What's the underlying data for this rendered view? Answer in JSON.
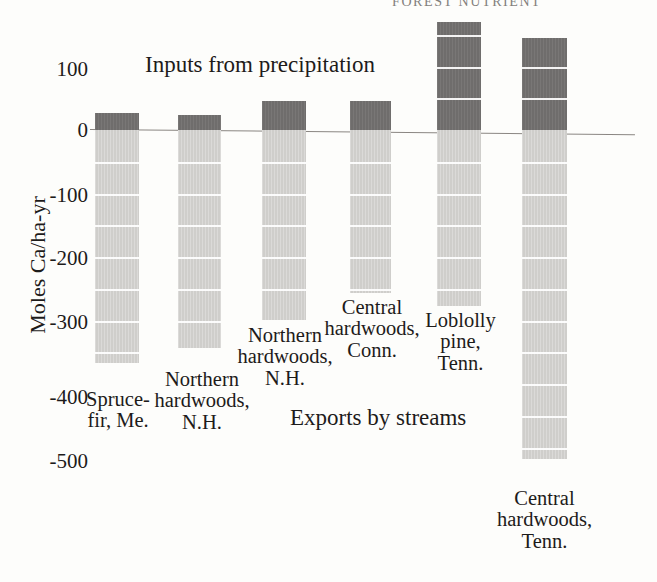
{
  "header": {
    "cropped_text": "FOREST NUTRIENT"
  },
  "chart_data": {
    "type": "bar",
    "title": "",
    "subtitle": "",
    "xlabel": "",
    "ylabel": "Moles Ca/ha-yr",
    "ylim": [
      -560,
      190
    ],
    "grid": true,
    "grid_interval": 50,
    "legend_position": "inline-annotation",
    "annotations": [
      {
        "text": "Inputs from precipitation",
        "x": 145,
        "y": 55
      },
      {
        "text": "Exports by streams",
        "x": 290,
        "y": 405
      }
    ],
    "ytick_labels": [
      "100",
      "0",
      "-100",
      "-200",
      "-300",
      "-400",
      "-500"
    ],
    "ytick_values": [
      100,
      0,
      -100,
      -200,
      -300,
      -400,
      -500
    ],
    "categories": [
      "Spruce-\nfir, Me.",
      "Northern\nhardwoods,\nN.H.",
      "Northern\nhardwoods,\nN.H.",
      "Central\nhardwoods,\nConn.",
      "Loblolly\npine,\nTenn.",
      "Central\nhardwoods,\nTenn."
    ],
    "series": [
      {
        "name": "Inputs from precipitation",
        "color": "#6f6d6c",
        "values": [
          27,
          24,
          46,
          46,
          172,
          147
        ]
      },
      {
        "name": "Exports by streams",
        "color": "#cfcecb",
        "values": [
          -370,
          -345,
          -300,
          -258,
          -278,
          -520
        ]
      }
    ]
  },
  "yticks": [
    {
      "label": "100",
      "top": 57,
      "right": 88
    },
    {
      "label": "0",
      "top": 118,
      "right": 88
    },
    {
      "label": "-100",
      "top": 183,
      "right": 88
    },
    {
      "label": "-200",
      "top": 246,
      "right": 88
    },
    {
      "label": "-300",
      "top": 310,
      "right": 88
    },
    {
      "label": "-400",
      "top": 385,
      "right": 88
    },
    {
      "label": "-500",
      "top": 449,
      "right": 88
    }
  ],
  "bars": [
    {
      "name": "spruce-fir-me",
      "left": 95,
      "width": 44,
      "pos_top": 113,
      "pos_height": 17,
      "neg_top": 130,
      "neg_height": 233,
      "label": "Spruce-\nfir, Me.",
      "label_left": 58,
      "label_top": 389,
      "label_width": 120
    },
    {
      "name": "northern-hardwoods-nh-1",
      "left": 178,
      "width": 43,
      "pos_top": 115,
      "pos_height": 15,
      "neg_top": 130,
      "neg_height": 218,
      "label": "Northern\nhardwoods,\nN.H.",
      "label_left": 152,
      "label_top": 369,
      "label_width": 100
    },
    {
      "name": "northern-hardwoods-nh-2",
      "left": 262,
      "width": 44,
      "pos_top": 101,
      "pos_height": 29,
      "neg_top": 130,
      "neg_height": 190,
      "label": "Northern\nhardwoods,\nN.H.",
      "label_left": 235,
      "label_top": 325,
      "label_width": 100
    },
    {
      "name": "central-hardwoods-conn",
      "left": 350,
      "width": 41,
      "pos_top": 101,
      "pos_height": 29,
      "neg_top": 130,
      "neg_height": 163,
      "label": "Central\nhardwoods,\nConn.",
      "label_left": 322,
      "label_top": 297,
      "label_width": 100
    },
    {
      "name": "loblolly-pine-tenn",
      "left": 437,
      "width": 44,
      "pos_top": 22,
      "pos_height": 108,
      "neg_top": 130,
      "neg_height": 176,
      "label": "Loblolly\npine,\nTenn.",
      "label_left": 413,
      "label_top": 310,
      "label_width": 95
    },
    {
      "name": "central-hardwoods-tenn",
      "left": 522,
      "width": 45,
      "pos_top": 38,
      "pos_height": 92,
      "neg_top": 130,
      "neg_height": 329,
      "label": "Central\nhardwoods,\nTenn.",
      "label_left": 492,
      "label_top": 488,
      "label_width": 105
    }
  ],
  "ytitle": "Moles Ca/ha-yr",
  "annotations": {
    "inputs": "Inputs from precipitation",
    "exports": "Exports by streams"
  },
  "colors": {
    "inputs_bar": "#6f6d6c",
    "exports_bar": "#cfcecb",
    "gridline": "#ffffff",
    "axis_line": "#8a8682",
    "text": "#1d1b1a",
    "background": "#fdfdfb"
  }
}
